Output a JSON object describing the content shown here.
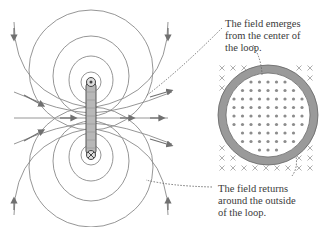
{
  "figure": {
    "top_caption_fragment": "(b)",
    "label_emerges": [
      "The field emerges",
      "from the center of",
      "the loop."
    ],
    "label_returns": [
      "The field returns",
      "around the outside",
      "of the loop."
    ]
  },
  "colors": {
    "field_line": "#8a8a8a",
    "arrow": "#707070",
    "loop_ring": "#9a9a9a",
    "dots": "#8c8c8c",
    "crosses": "#9a9a9a",
    "text": "#3a3a3a"
  }
}
